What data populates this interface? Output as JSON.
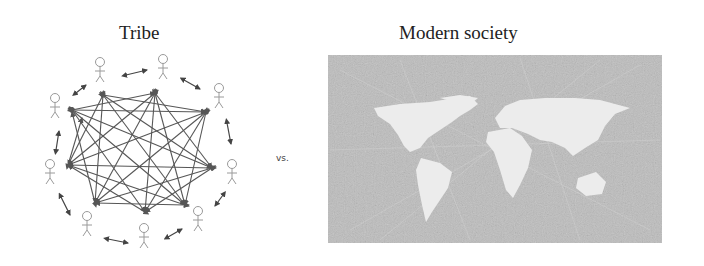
{
  "left_panel": {
    "title": "Tribe",
    "people_count": 9,
    "figure_color": "#9a9a9a",
    "connection_color": "#444444"
  },
  "separator": {
    "text": "vs."
  },
  "right_panel": {
    "title": "Modern society",
    "image_description": "gray world map with network connection lines",
    "background_color": "#bdbdbd",
    "continent_color": "#ececec"
  }
}
